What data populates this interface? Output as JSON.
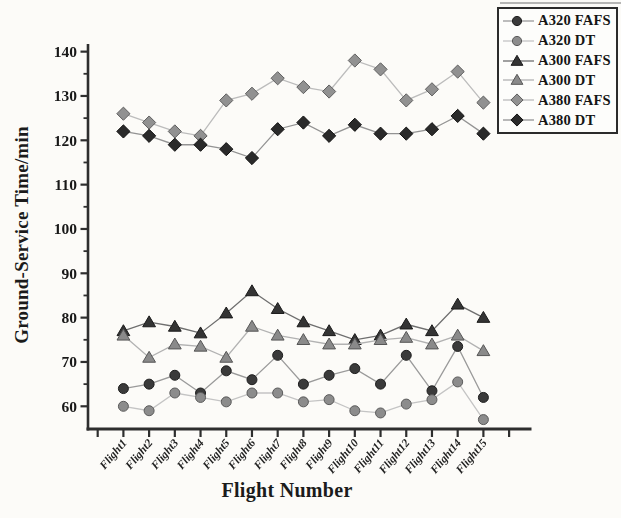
{
  "figure": {
    "background": "#fcfbf8",
    "axis_color": "#2e2e2e",
    "tick_label_color": "#181818"
  },
  "chart_data": {
    "type": "line",
    "title": "",
    "xlabel": "Flight Number",
    "ylabel": "Ground-Service Time/min",
    "categories": [
      "Flight1",
      "Flight2",
      "Flight3",
      "Flight4",
      "Flight5",
      "Flight6",
      "Flight7",
      "Flight8",
      "Flight9",
      "Flight10",
      "Flight11",
      "Flight12",
      "Flight13",
      "Flight14",
      "Flight15"
    ],
    "ylim": [
      55,
      141.5
    ],
    "yticks_major": [
      60,
      70,
      80,
      90,
      100,
      110,
      120,
      130,
      140
    ],
    "yticks_minor": [
      65,
      75,
      85,
      95,
      105,
      115,
      125,
      135
    ],
    "grid": false,
    "legend_position": "top-right",
    "series": [
      {
        "name": "A320 FAFS",
        "marker": "circle",
        "marker_color": "#3a3a3a",
        "marker_edge": "#1e1e1e",
        "line_color": "#9a9a9a",
        "values": [
          64,
          65,
          67,
          63,
          68,
          66,
          71.5,
          65,
          67,
          68.5,
          65,
          71.5,
          63.5,
          73.5,
          62
        ]
      },
      {
        "name": "A320 DT",
        "marker": "circle",
        "marker_color": "#8c8c8c",
        "marker_edge": "#5a5a5a",
        "line_color": "#c4c4c4",
        "values": [
          60,
          59,
          63,
          62,
          61,
          63,
          63,
          61,
          61.5,
          59,
          58.5,
          60.5,
          61.5,
          65.5,
          57
        ]
      },
      {
        "name": "A300 FAFS",
        "marker": "triangle",
        "marker_color": "#343434",
        "marker_edge": "#1a1a1a",
        "line_color": "#6e6e6e",
        "values": [
          77,
          79,
          78,
          76.5,
          81,
          86,
          82,
          79,
          77,
          75,
          76,
          78.5,
          77,
          83,
          80
        ]
      },
      {
        "name": "A300 DT",
        "marker": "triangle",
        "marker_color": "#8a8a8a",
        "marker_edge": "#565656",
        "line_color": "#b2b2b2",
        "values": [
          76,
          71,
          74,
          73.5,
          71,
          78,
          76,
          75,
          74,
          74,
          75,
          75.5,
          74,
          76,
          72.5
        ]
      },
      {
        "name": "A380 FAFS",
        "marker": "diamond",
        "marker_color": "#919191",
        "marker_edge": "#5e5e5e",
        "line_color": "#bcbcbc",
        "values": [
          126,
          124,
          122,
          121,
          129,
          130.5,
          134,
          132,
          131,
          138,
          136,
          129,
          131.5,
          135.5,
          128.5
        ]
      },
      {
        "name": "A380 DT",
        "marker": "diamond",
        "marker_color": "#2a2a2a",
        "marker_edge": "#111111",
        "line_color": "#939393",
        "values": [
          122,
          121,
          119,
          119,
          118,
          116,
          122.5,
          124,
          121,
          123.5,
          121.5,
          121.5,
          122.5,
          125.5,
          121.5
        ]
      }
    ]
  }
}
